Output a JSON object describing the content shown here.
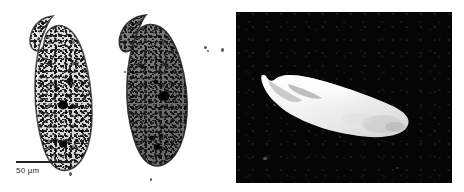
{
  "figure": {
    "background_color": "#ffffff",
    "width": 464,
    "height": 192
  },
  "panel_a": {
    "name": "light-micrograph-panel",
    "type": "light micrograph",
    "background_color": "#ffffff",
    "specimen_count": 2,
    "specimens": [
      {
        "label": "left-specimen",
        "description": "Stained elongate ciliate cell, pale cytoplasm with dark granules, hooked anterior end at upper left",
        "tone": "light"
      },
      {
        "label": "right-specimen",
        "description": "Stained elongate ciliate cell, darker densely granular cytoplasm, hooked anterior end at upper left",
        "tone": "dark"
      }
    ],
    "scale_bar": {
      "label": "50 µm",
      "value": 50,
      "unit": "µm",
      "bar_color": "#222222",
      "length_px": 55
    }
  },
  "panel_b": {
    "name": "dark-field-micrograph-panel",
    "type": "scanning electron / dark-field micrograph",
    "background_color": "#050505",
    "specimen": {
      "label": "sem-specimen",
      "description": "Bright elongate organism with tapered posterior and curved anterior lobe, oriented diagonally from upper left to lower right",
      "surface_color": "#f2f2f2"
    }
  }
}
